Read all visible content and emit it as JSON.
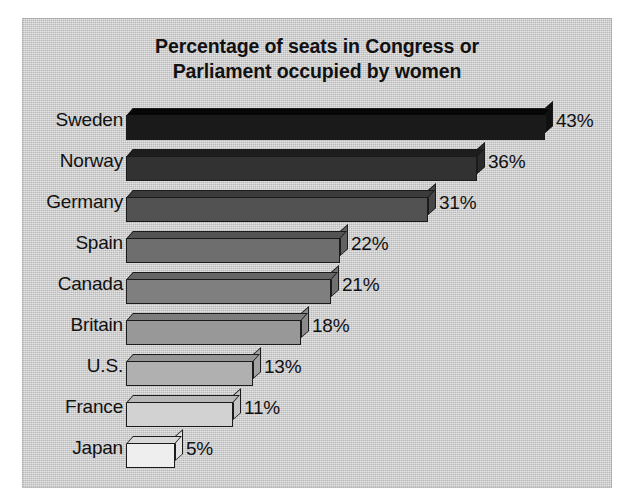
{
  "chart_data": {
    "type": "bar",
    "orientation": "horizontal",
    "title": "Percentage of seats in Congress or Parliament occupied by women",
    "title_lines": [
      "Percentage of seats in Congress or",
      "Parliament occupied by women"
    ],
    "xlabel": "",
    "ylabel": "",
    "categories": [
      "Sweden",
      "Norway",
      "Germany",
      "Spain",
      "Canada",
      "Britain",
      "U.S.",
      "France",
      "Japan"
    ],
    "values": [
      43,
      36,
      31,
      22,
      21,
      18,
      13,
      11,
      5
    ],
    "value_labels": [
      "43%",
      "36%",
      "31%",
      "22%",
      "21%",
      "18%",
      "13%",
      "11%",
      "5%"
    ],
    "unit": "%",
    "xlim": [
      0,
      43
    ],
    "grid": false,
    "legend": false,
    "axis_visible": false,
    "style": "3d-bars",
    "bar_colors": [
      "#1a1a1a",
      "#323232",
      "#525252",
      "#6e6e6e",
      "#7f7f7f",
      "#989898",
      "#b0b0b0",
      "#d2d2d2",
      "#eeeeee"
    ],
    "bar_top_colors": [
      "#070707",
      "#1d1d1d",
      "#3b3b3b",
      "#545454",
      "#656565",
      "#7d7d7d",
      "#959595",
      "#b8b8b8",
      "#d8d8d8"
    ],
    "bar_side_colors": [
      "#101010",
      "#2a2a2a",
      "#474747",
      "#616161",
      "#717171",
      "#8a8a8a",
      "#a2a2a2",
      "#c4c4c4",
      "#e2e2e2"
    ]
  },
  "figure": {
    "panel_background": "#c9c9c9",
    "page_background": "#ffffff",
    "text_color": "#111111",
    "outline_color": "#1b1b1b"
  }
}
